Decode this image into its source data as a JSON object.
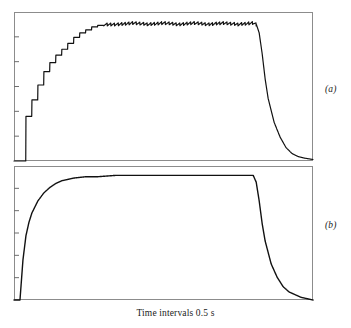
{
  "figure": {
    "axis_caption": "Time intervals 0.5 s",
    "edge_artifact": "",
    "panels": [
      {
        "id": "a",
        "label": "(a)"
      },
      {
        "id": "b",
        "label": "(b)"
      }
    ]
  },
  "chart_data": [
    {
      "type": "line",
      "title": "",
      "subtitle": "",
      "panel_label": "(a)",
      "xlabel": "Time intervals 0.5 s",
      "ylabel": "",
      "xlim": [
        0,
        100
      ],
      "ylim": [
        0,
        100
      ],
      "grid": false,
      "legend": null,
      "axis_frame": "box",
      "y_tick_count": 5,
      "x_tick_count": 0,
      "line_color": "#111111",
      "line_width": 1.2,
      "description": "Stepped (quantized) rise to a rippling plateau, then sigmoidal decay back to baseline",
      "features": {
        "rise_type": "staircase-steps",
        "plateau_type": "sawtooth-ripple",
        "decay_type": "sigmoid-then-exponential",
        "onset_x": 2,
        "plateau_start_x": 30,
        "plateau_level_y": 92,
        "offset_x": 81,
        "baseline_y": 0,
        "ripple_amplitude_y": 2.0,
        "ripple_count": 42,
        "step_count": 14
      },
      "x": [
        0,
        1,
        2,
        3,
        4,
        5,
        6,
        7,
        8,
        9,
        10,
        12,
        14,
        16,
        18,
        20,
        22,
        24,
        26,
        28,
        30,
        35,
        40,
        45,
        50,
        55,
        60,
        65,
        70,
        75,
        80,
        81,
        82,
        83,
        84,
        85,
        87,
        89,
        91,
        93,
        95,
        97,
        100
      ],
      "values": [
        0,
        0,
        0,
        18,
        30,
        36,
        41,
        47,
        51,
        56,
        60,
        66,
        71,
        75,
        79,
        83,
        86,
        88,
        90,
        91,
        92,
        92,
        93,
        92,
        93,
        92,
        93,
        92,
        93,
        92,
        93,
        92,
        86,
        72,
        55,
        42,
        26,
        16,
        9,
        5,
        3,
        2,
        1
      ]
    },
    {
      "type": "line",
      "title": "",
      "subtitle": "",
      "panel_label": "(b)",
      "xlabel": "Time intervals 0.5 s",
      "ylabel": "",
      "xlim": [
        0,
        100
      ],
      "ylim": [
        0,
        100
      ],
      "grid": false,
      "legend": null,
      "axis_frame": "box",
      "y_tick_count": 5,
      "x_tick_count": 0,
      "line_color": "#111111",
      "line_width": 1.4,
      "description": "Smooth exponential rise to a flat plateau, then sigmoidal decay back to baseline",
      "features": {
        "rise_type": "smooth-exponential",
        "plateau_type": "flat",
        "decay_type": "sigmoid-then-exponential",
        "onset_x": 2,
        "plateau_start_x": 26,
        "plateau_level_y": 93,
        "offset_x": 81,
        "baseline_y": 0,
        "ripple_amplitude_y": 0,
        "ripple_count": 0,
        "step_count": 0
      },
      "x": [
        0,
        1,
        2,
        3,
        4,
        5,
        6,
        8,
        10,
        12,
        14,
        16,
        18,
        20,
        24,
        28,
        34,
        40,
        50,
        60,
        70,
        80,
        81,
        82,
        83,
        84,
        86,
        88,
        90,
        92,
        94,
        96,
        98,
        100
      ],
      "values": [
        0,
        0,
        0,
        30,
        48,
        58,
        65,
        74,
        80,
        84,
        87,
        89,
        90,
        91,
        92,
        92,
        93,
        93,
        93,
        93,
        93,
        93,
        88,
        74,
        57,
        44,
        27,
        17,
        10,
        6,
        4,
        2,
        1,
        0
      ]
    }
  ]
}
